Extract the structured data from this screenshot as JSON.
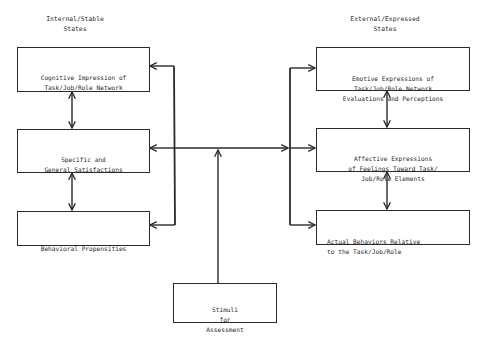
{
  "diagram": {
    "left_column": {
      "heading": "Internal/Stable\nStates",
      "boxes": [
        {
          "id": "cognitive",
          "text": "Cognitive Impression of\nTask/Job/Role Network"
        },
        {
          "id": "satisfactions",
          "text": "Specific and\nGeneral Satisfactions"
        },
        {
          "id": "propensities",
          "text": "Behavioral Propensities"
        }
      ]
    },
    "right_column": {
      "heading": "External/Expressed\nStates",
      "boxes": [
        {
          "id": "emotive",
          "text": "Emotive Expressions of\nTask/Job/Role Network\nEvaluations and Perceptions"
        },
        {
          "id": "affective",
          "text": "Affective Expressions\nof Feelings Toward Task/\nJob/Role Elements"
        },
        {
          "id": "behaviors",
          "text": "Actual Behaviors Relative\nto the Task/Job/Role"
        }
      ]
    },
    "stimuli": {
      "text": "Stimuli\nfor\nAssessment"
    },
    "connections": [
      {
        "from": "cognitive",
        "to": "satisfactions",
        "type": "bidirectional"
      },
      {
        "from": "satisfactions",
        "to": "propensities",
        "type": "bidirectional"
      },
      {
        "from": "emotive",
        "to": "affective",
        "type": "bidirectional"
      },
      {
        "from": "affective",
        "to": "behaviors",
        "type": "bidirectional"
      },
      {
        "from": "stimuli",
        "to": "center-junction",
        "type": "arrow"
      },
      {
        "from": "center-junction",
        "to": "left-bus",
        "type": "arrow"
      },
      {
        "from": "center-junction",
        "to": "right-bus",
        "type": "arrow"
      },
      {
        "from": "left-bus",
        "to": [
          "cognitive",
          "satisfactions",
          "propensities"
        ],
        "type": "arrow"
      },
      {
        "from": "right-bus",
        "to": [
          "emotive",
          "affective",
          "behaviors"
        ],
        "type": "arrow"
      }
    ],
    "line_color": "#2a2a2a"
  }
}
